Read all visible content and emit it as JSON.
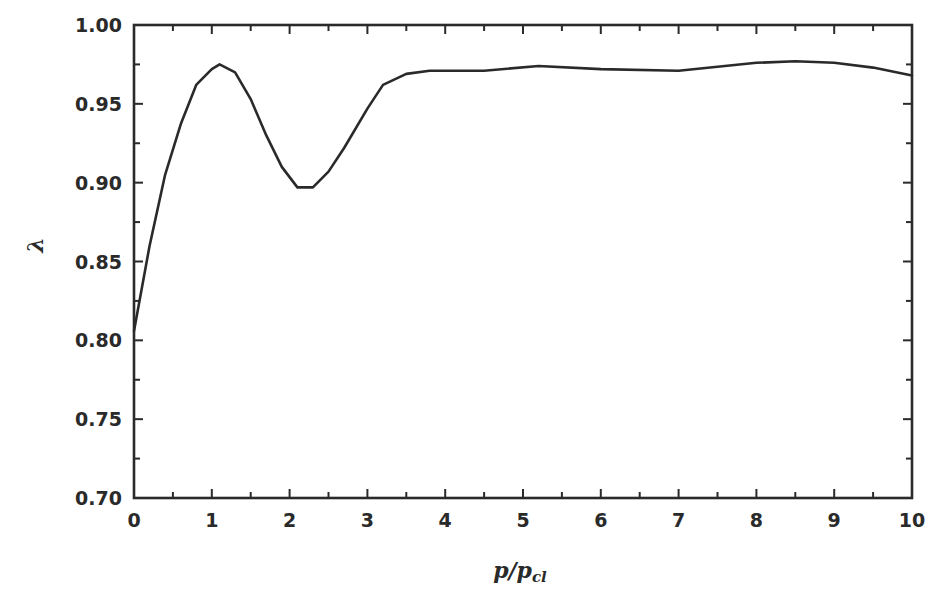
{
  "chart_data": {
    "type": "line",
    "title": "",
    "xlabel": "p/p_cl",
    "ylabel": "λ",
    "xlim": [
      0,
      10
    ],
    "ylim": [
      0.7,
      1.0
    ],
    "grid": false,
    "legend": null,
    "x_ticks": [
      "0",
      "1",
      "2",
      "3",
      "4",
      "5",
      "6",
      "7",
      "8",
      "9",
      "10"
    ],
    "y_ticks": [
      "0.70",
      "0.75",
      "0.80",
      "0.85",
      "0.90",
      "0.95",
      "1.00"
    ],
    "series": [
      {
        "name": "λ",
        "x": [
          0,
          0.2,
          0.4,
          0.6,
          0.8,
          1.0,
          1.1,
          1.3,
          1.5,
          1.7,
          1.9,
          2.1,
          2.3,
          2.5,
          2.7,
          3.0,
          3.2,
          3.5,
          3.8,
          4.5,
          5.2,
          6.0,
          7.0,
          8.0,
          8.5,
          9.0,
          9.5,
          10.0
        ],
        "values": [
          0.806,
          0.86,
          0.905,
          0.937,
          0.962,
          0.972,
          0.975,
          0.97,
          0.953,
          0.93,
          0.91,
          0.897,
          0.897,
          0.907,
          0.922,
          0.947,
          0.962,
          0.969,
          0.971,
          0.971,
          0.974,
          0.972,
          0.971,
          0.976,
          0.977,
          0.976,
          0.973,
          0.968
        ]
      }
    ]
  },
  "colors": {
    "line": "#2a2a2a",
    "axis": "#2a2a2a",
    "background": "#ffffff"
  },
  "labels": {
    "x_axis_main": "p/p",
    "x_axis_sub": "cl",
    "y_axis": "λ"
  }
}
